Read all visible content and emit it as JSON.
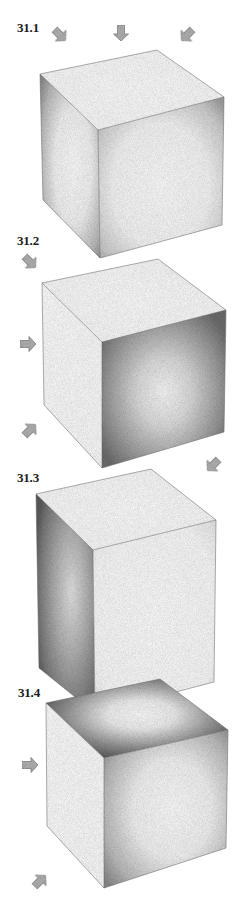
{
  "figures": [
    {
      "label": "31.1",
      "label_pos": [
        17,
        20
      ],
      "light_description": "light from above (three arrows pointing down onto top face)",
      "arrows": [
        {
          "x": 60,
          "y": 35,
          "angle": 45
        },
        {
          "x": 121,
          "y": 33,
          "angle": 90
        },
        {
          "x": 187,
          "y": 35,
          "angle": 135
        }
      ],
      "cube": {
        "tl": [
          40,
          74
        ],
        "back": [
          157,
          50
        ],
        "tr": [
          224,
          97
        ],
        "ft": [
          98,
          130
        ],
        "bl": [
          43,
          200
        ],
        "fb": [
          100,
          258
        ],
        "br": [
          222,
          225
        ]
      },
      "shading": {
        "top": "light",
        "left": "mid",
        "right": "mid-light"
      }
    },
    {
      "label": "31.2",
      "label_pos": [
        17,
        233
      ],
      "light_description": "light from left (arrows pointing right and up-right)",
      "arrows": [
        {
          "x": 30,
          "y": 262,
          "angle": 45
        },
        {
          "x": 28,
          "y": 344,
          "angle": 0
        },
        {
          "x": 30,
          "y": 430,
          "angle": -45
        },
        {
          "x": 213,
          "y": 465,
          "angle": 135
        }
      ],
      "cube": {
        "tl": [
          42,
          283
        ],
        "back": [
          158,
          259
        ],
        "tr": [
          226,
          310
        ],
        "ft": [
          102,
          342
        ],
        "bl": [
          44,
          405
        ],
        "fb": [
          102,
          468
        ],
        "br": [
          224,
          432
        ]
      },
      "shading": {
        "top": "light",
        "left": "white",
        "right": "dark"
      }
    },
    {
      "label": "31.3",
      "label_pos": [
        17,
        470
      ],
      "light_description": "light from right (arrow from upper right)",
      "arrows": [],
      "cube": {
        "tl": [
          36,
          494
        ],
        "back": [
          151,
          469
        ],
        "tr": [
          216,
          520
        ],
        "ft": [
          93,
          550
        ],
        "bl": [
          39,
          668
        ],
        "fb": [
          95,
          713
        ],
        "br": [
          214,
          682
        ]
      },
      "shading": {
        "top": "light",
        "left": "dark",
        "right": "light"
      }
    },
    {
      "label": "31.4",
      "label_pos": [
        18,
        685
      ],
      "light_description": "light from left and below",
      "arrows": [
        {
          "x": 30,
          "y": 765,
          "angle": 0
        },
        {
          "x": 40,
          "y": 881,
          "angle": -45
        }
      ],
      "cube": {
        "tl": [
          46,
          703
        ],
        "back": [
          160,
          679
        ],
        "tr": [
          228,
          730
        ],
        "ft": [
          104,
          758
        ],
        "bl": [
          47,
          826
        ],
        "fb": [
          104,
          888
        ],
        "br": [
          226,
          848
        ]
      },
      "shading": {
        "top": "dark",
        "left": "white",
        "right": "mid"
      }
    }
  ],
  "colors": {
    "background": "#ffffff",
    "edge": "#6a6a6a",
    "arrow_fill": "#b5b5b5",
    "arrow_stroke": "#8a8a8a",
    "label": "#1a1a1a"
  }
}
